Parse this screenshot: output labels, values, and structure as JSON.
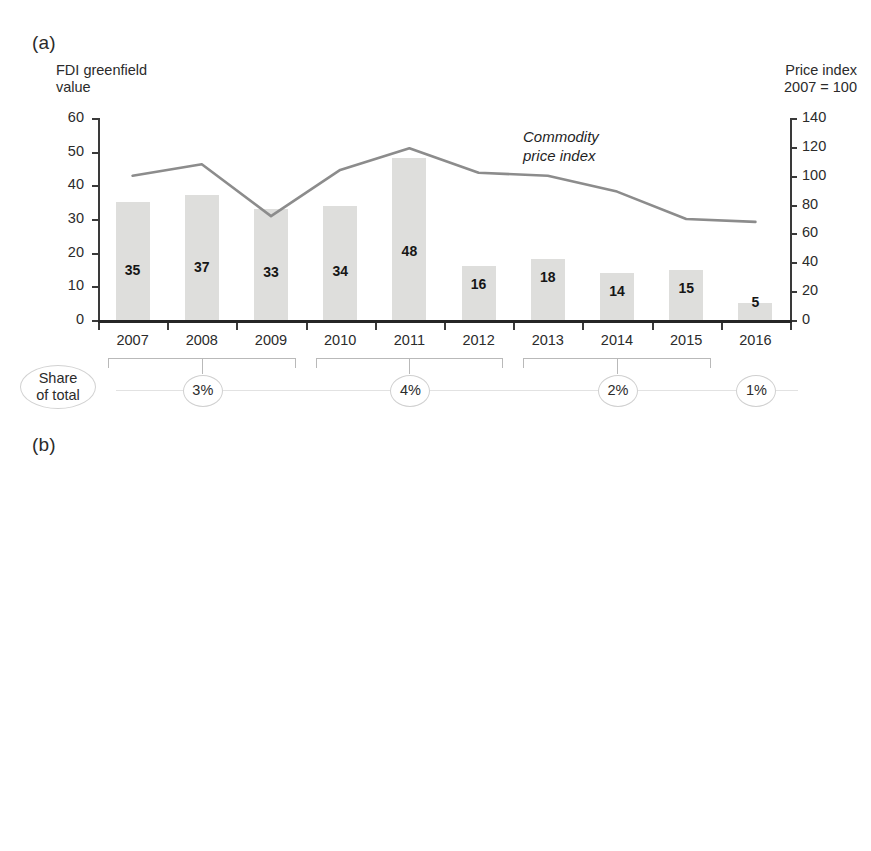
{
  "page": {
    "header_faint": ""
  },
  "panel_a": {
    "letter": "(a)",
    "left_axis_title": "FDI greenfield\nvalue",
    "right_axis_title": "Price index\n2007 = 100",
    "left_ticks": [
      "0",
      "10",
      "20",
      "30",
      "40",
      "50",
      "60"
    ],
    "right_ticks": [
      "0",
      "20",
      "40",
      "60",
      "80",
      "100",
      "120",
      "140"
    ],
    "series_label": "Commodity\nprice index",
    "share_caption": "Share\nof total",
    "share_groups": [
      {
        "label": "3%",
        "years": [
          "2007",
          "2008",
          "2009"
        ]
      },
      {
        "label": "4%",
        "years": [
          "2010",
          "2011",
          "2012"
        ]
      },
      {
        "label": "2%",
        "years": [
          "2013",
          "2014",
          "2015"
        ]
      },
      {
        "label": "1%",
        "years": [
          "2016"
        ]
      }
    ]
  },
  "panel_b": {
    "letter": "(b)",
    "left_ticks": [
      "-10",
      "0",
      "10",
      "20",
      "30",
      "40",
      "50",
      "60",
      "70",
      "80"
    ],
    "share_caption": "Share\nof total",
    "share_groups": [
      {
        "label": "5%",
        "years": [
          "2007",
          "2008",
          "2009"
        ]
      },
      {
        "label": "10%",
        "years": [
          "2010",
          "2011",
          "2012"
        ]
      },
      {
        "label": "2%",
        "years": [
          "2013",
          "2014",
          "2015"
        ]
      },
      {
        "label": "0%",
        "years": [
          "2016"
        ]
      }
    ]
  },
  "chart_data": [
    {
      "type": "bar",
      "panel": "(a)",
      "title": "",
      "xlabel": "",
      "ylabel": "FDI greenfield value",
      "y2label": "Price index 2007 = 100",
      "categories": [
        "2007",
        "2008",
        "2009",
        "2010",
        "2011",
        "2012",
        "2013",
        "2014",
        "2015",
        "2016"
      ],
      "values": [
        35,
        37,
        33,
        34,
        48,
        16,
        18,
        14,
        15,
        5
      ],
      "ylim": [
        0,
        60
      ],
      "yticks": [
        0,
        10,
        20,
        30,
        40,
        50,
        60
      ],
      "y2lim": [
        0,
        140
      ],
      "y2ticks": [
        0,
        20,
        40,
        60,
        80,
        100,
        120,
        140
      ],
      "grid": false,
      "legend": "none",
      "bar_color": "#dededc",
      "series": [
        {
          "name": "Commodity price index",
          "type": "line",
          "axis": "right",
          "color": "#8c8c8c",
          "values": [
            100,
            108,
            72,
            104,
            119,
            102,
            100,
            89,
            70,
            68
          ]
        }
      ],
      "share_of_total": [
        "3%",
        "4%",
        "2%",
        "1%"
      ]
    },
    {
      "type": "bar",
      "panel": "(b)",
      "title": "",
      "xlabel": "",
      "ylabel": "",
      "categories": [
        "2007",
        "2008",
        "2009",
        "2010",
        "2011",
        "2012",
        "2013",
        "2014",
        "2015",
        "2016"
      ],
      "values": [
        37,
        43,
        19,
        38,
        68,
        22,
        13,
        3,
        11,
        1
      ],
      "ylim": [
        -10,
        80
      ],
      "yticks": [
        -10,
        0,
        10,
        20,
        30,
        40,
        50,
        60,
        70,
        80
      ],
      "grid": false,
      "legend": "none",
      "bar_color": "#a6a6a6",
      "share_of_total": [
        "5%",
        "10%",
        "2%",
        "0%"
      ]
    }
  ]
}
